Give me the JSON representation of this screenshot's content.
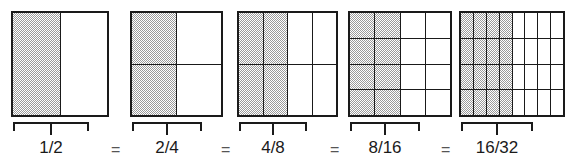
{
  "figure": {
    "ink_color": "#1a1a1a",
    "shade_color": "#9a9a9a",
    "background_color": "#ffffff",
    "equals_sign": "=",
    "groups": [
      {
        "id": "half",
        "label": "1/2",
        "numerator": 1,
        "denominator": 2,
        "columns": 2,
        "rows": 1,
        "shaded_columns": 1,
        "shaded_cells": 1,
        "total_cells": 2,
        "has_equals": false,
        "rect_x": 11,
        "rect_width": 98,
        "rect_height": 106,
        "brace_x": 13,
        "brace_width": 76,
        "brace_y": 122,
        "label_x": 13,
        "label_width": 76,
        "equals_x": 0
      },
      {
        "id": "two-fourths",
        "label": "2/4",
        "numerator": 2,
        "denominator": 4,
        "columns": 2,
        "rows": 2,
        "shaded_columns": 1,
        "shaded_cells": 2,
        "total_cells": 4,
        "has_equals": true,
        "rect_x": 130,
        "rect_width": 93,
        "rect_height": 106,
        "brace_x": 132,
        "brace_width": 70,
        "brace_y": 122,
        "label_x": 132,
        "label_width": 70,
        "equals_x": 111
      },
      {
        "id": "four-eighths",
        "label": "4/8",
        "numerator": 4,
        "denominator": 8,
        "columns": 4,
        "rows": 2,
        "shaded_columns": 2,
        "shaded_cells": 4,
        "total_cells": 8,
        "has_equals": true,
        "rect_x": 237,
        "rect_width": 101,
        "rect_height": 106,
        "brace_x": 239,
        "brace_width": 68,
        "brace_y": 122,
        "label_x": 239,
        "label_width": 68,
        "equals_x": 221
      },
      {
        "id": "eight-sixteenths",
        "label": "8/16",
        "numerator": 8,
        "denominator": 16,
        "columns": 4,
        "rows": 4,
        "shaded_columns": 2,
        "shaded_cells": 8,
        "total_cells": 16,
        "has_equals": true,
        "rect_x": 348,
        "rect_width": 104,
        "rect_height": 106,
        "brace_x": 350,
        "brace_width": 70,
        "brace_y": 122,
        "label_x": 346,
        "label_width": 78,
        "equals_x": 330
      },
      {
        "id": "sixteen-thirtyseconds",
        "label": "16/32",
        "numerator": 16,
        "denominator": 32,
        "columns": 8,
        "rows": 4,
        "shaded_columns": 4,
        "shaded_cells": 16,
        "total_cells": 32,
        "has_equals": true,
        "rect_x": 459,
        "rect_width": 106,
        "rect_height": 106,
        "brace_x": 461,
        "brace_width": 72,
        "brace_y": 122,
        "label_x": 456,
        "label_width": 82,
        "equals_x": 441
      }
    ]
  }
}
